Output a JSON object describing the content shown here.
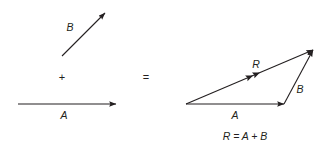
{
  "figure": {
    "background_color": "#ffffff",
    "stroke_color": "#231f20",
    "text_color": "#231f20",
    "width": 334,
    "height": 153
  },
  "operands": {
    "vector_b": {
      "label": "B",
      "label_x": 70,
      "label_y": 31,
      "x1": 62,
      "y1": 56,
      "x2": 105,
      "y2": 13,
      "arrowheads": 1
    },
    "plus_symbol": {
      "label": "+",
      "x": 62,
      "y": 81
    },
    "vector_a": {
      "label": "A",
      "label_x": 64,
      "label_y": 119,
      "x1": 18,
      "y1": 104,
      "x2": 116,
      "y2": 104,
      "arrowheads": 1
    }
  },
  "equals_symbol": {
    "label": "=",
    "x": 146,
    "y": 81
  },
  "resultant": {
    "vector_a": {
      "label": "A",
      "label_x": 235,
      "label_y": 119,
      "x1": 186,
      "y1": 104,
      "x2": 284,
      "y2": 104,
      "arrowheads": 1
    },
    "vector_b": {
      "label": "B",
      "label_x": 300,
      "label_y": 93,
      "x1": 284,
      "y1": 104,
      "x2": 313,
      "y2": 50,
      "arrowheads": 1
    },
    "vector_r": {
      "label": "R",
      "label_x": 256,
      "label_y": 68,
      "x1": 186,
      "y1": 104,
      "x2": 313,
      "y2": 50,
      "arrowheads": 2,
      "note": "double arrowhead marker at midpoint indicates resultant"
    }
  },
  "caption": {
    "text": "R = A + B",
    "x": 245,
    "y": 140
  }
}
